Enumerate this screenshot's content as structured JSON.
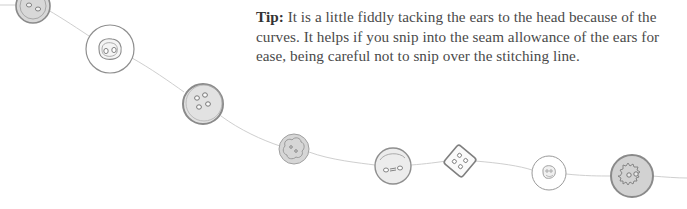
{
  "tip": {
    "label": "Tip:",
    "text": " It is a little fiddly tacking the ears to the head because of the curves. It helps if you snip into the seam allowance of the ears for ease, being careful not to snip over the stitching line."
  },
  "illustration": {
    "description": "string of hand-drawn buttons",
    "buttons": [
      {
        "name": "button-two-hole-grey"
      },
      {
        "name": "button-two-hole-white-large"
      },
      {
        "name": "button-four-hole-grey"
      },
      {
        "name": "button-flower-grey"
      },
      {
        "name": "button-oval-holes-light"
      },
      {
        "name": "button-square-four-hole"
      },
      {
        "name": "button-small-white"
      },
      {
        "name": "button-fuzzy-grey"
      }
    ],
    "colors": {
      "line": "#c8c8c8",
      "stroke": "#8a8a8a",
      "fill_grey": "#dcdcdc",
      "fill_light": "#ececec",
      "text": "#4a4a4a"
    }
  }
}
